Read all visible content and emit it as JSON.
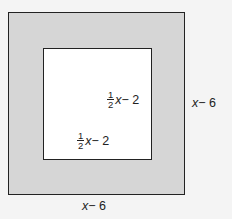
{
  "diagram": {
    "outer_square": {
      "fill": "#d6d6d6",
      "stroke": "#222222",
      "right_label": {
        "var": "x",
        "rest": " − 6"
      },
      "bottom_label": {
        "var": "x",
        "rest": " − 6"
      }
    },
    "inner_square": {
      "fill": "#ffffff",
      "stroke": "#222222",
      "right_label": {
        "num": "1",
        "den": "2",
        "var": "x",
        "rest": " − 2"
      },
      "bottom_label": {
        "num": "1",
        "den": "2",
        "var": "x",
        "rest": " − 2"
      }
    }
  }
}
